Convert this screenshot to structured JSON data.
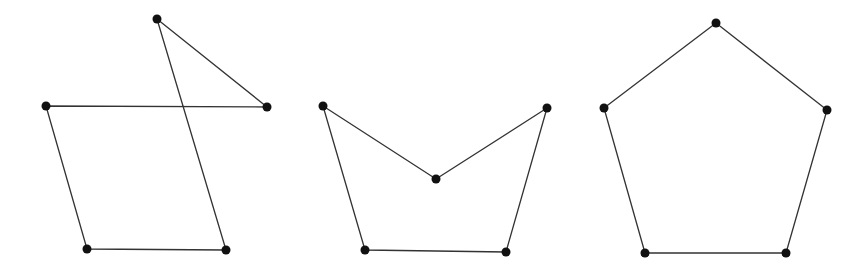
{
  "canvas": {
    "width": 864,
    "height": 270,
    "background": "#ffffff"
  },
  "style": {
    "line_color": "#333333",
    "line_width": 1.3,
    "vertex_color": "#111111",
    "vertex_radius": 4.5
  },
  "figures": [
    {
      "id": "self-intersecting-pentagon",
      "description": "Complex (self-intersecting) pentagon",
      "vertices": [
        [
          157,
          19
        ],
        [
          267,
          107
        ],
        [
          46,
          106
        ],
        [
          87,
          249
        ],
        [
          226,
          250
        ]
      ],
      "closed": true
    },
    {
      "id": "concave-pentagon",
      "description": "Concave pentagon",
      "vertices": [
        [
          323,
          106
        ],
        [
          436,
          179
        ],
        [
          547,
          108
        ],
        [
          506,
          252
        ],
        [
          365,
          250
        ]
      ],
      "closed": true
    },
    {
      "id": "convex-pentagon",
      "description": "Convex (regular) pentagon",
      "vertices": [
        [
          716,
          23
        ],
        [
          827,
          110
        ],
        [
          786,
          253
        ],
        [
          645,
          253
        ],
        [
          604,
          108
        ]
      ],
      "closed": true
    }
  ]
}
